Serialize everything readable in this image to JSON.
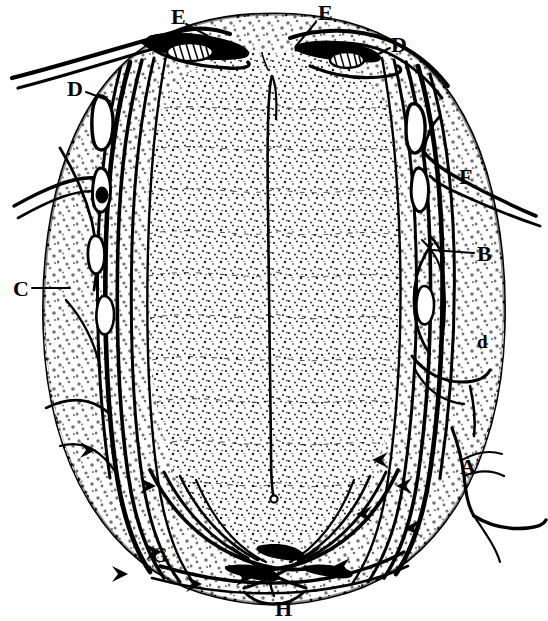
{
  "figure": {
    "kind": "anatomical-cross-section",
    "style": "black-and-white stippled line engraving",
    "background_color": "#ffffff",
    "ink_color": "#000000",
    "width": 548,
    "height": 621
  },
  "labels": [
    {
      "id": "E-left",
      "text": "E",
      "x": 171,
      "y": 6,
      "size": "major"
    },
    {
      "id": "E-right",
      "text": "E",
      "x": 318,
      "y": 2,
      "size": "major"
    },
    {
      "id": "D-right",
      "text": "D",
      "x": 391,
      "y": 34,
      "size": "major"
    },
    {
      "id": "D-left",
      "text": "D",
      "x": 67,
      "y": 78,
      "size": "major"
    },
    {
      "id": "F",
      "text": "F",
      "x": 459,
      "y": 166,
      "size": "major"
    },
    {
      "id": "B",
      "text": "B",
      "x": 477,
      "y": 243,
      "size": "major"
    },
    {
      "id": "C",
      "text": "C",
      "x": 13,
      "y": 278,
      "size": "major"
    },
    {
      "id": "d",
      "text": "d",
      "x": 477,
      "y": 332,
      "size": "minor"
    },
    {
      "id": "A",
      "text": "A",
      "x": 460,
      "y": 456,
      "size": "major"
    },
    {
      "id": "G",
      "text": "G",
      "x": 151,
      "y": 544,
      "size": "major"
    },
    {
      "id": "H",
      "text": "H",
      "x": 275,
      "y": 598,
      "size": "major"
    }
  ],
  "leader_lines": [
    {
      "id": "leader-E-left",
      "from": [
        186,
        24
      ],
      "to": [
        208,
        36
      ]
    },
    {
      "id": "leader-E-right",
      "from": [
        316,
        20
      ],
      "to": [
        296,
        44
      ]
    },
    {
      "id": "leader-D-right",
      "from": [
        390,
        46
      ],
      "to": [
        372,
        56
      ]
    },
    {
      "id": "leader-D-left",
      "from": [
        86,
        92
      ],
      "to": [
        108,
        100
      ]
    },
    {
      "id": "leader-B",
      "from": [
        474,
        253
      ],
      "to": [
        432,
        250
      ]
    },
    {
      "id": "leader-C",
      "from": [
        31,
        288
      ],
      "to": [
        66,
        288
      ]
    }
  ],
  "structures": {
    "outline_name": "cord-outline",
    "central_canal_name": "central-canal-slit",
    "grey_matter_name": "grey-matter-core",
    "white_matter_name": "white-matter-mantle",
    "anterior_fissure_name": "anterior-median-fissure",
    "posterior_fissure_name": "posterior-median-sulcus",
    "fibre_bundle_name": "nerve-fibre-bundle",
    "decussation_name": "fibre-decussation"
  }
}
